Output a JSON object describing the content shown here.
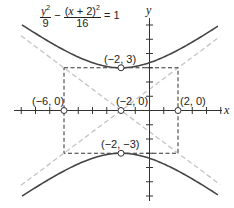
{
  "equation": {
    "term1_num_var": "y",
    "term1_num_exp": "2",
    "term1_den": "9",
    "operator": "−",
    "term2_num_open": "(",
    "term2_num_var": "x",
    "term2_num_rest": " + 2)",
    "term2_num_exp": "2",
    "term2_den": "16",
    "equals": "= 1"
  },
  "axes": {
    "x_label": "x",
    "y_label": "y",
    "origin_px": [
      149.5,
      110.5
    ],
    "unit_px": 14.25,
    "x_ticks": [
      -9,
      -8,
      -7,
      -6,
      -5,
      -4,
      -3,
      -2,
      -1,
      1,
      2,
      3,
      4,
      5
    ],
    "y_ticks": [
      -6,
      -5,
      -4,
      -3,
      -2,
      -1,
      1,
      2,
      3,
      4,
      5,
      6
    ]
  },
  "points": [
    {
      "label": "(−2, 3)",
      "x": -2,
      "y": 3,
      "role": "vertex"
    },
    {
      "label": "(−2, −3)",
      "x": -2,
      "y": -3,
      "role": "vertex"
    },
    {
      "label": "(−6, 0)",
      "x": -6,
      "y": 0,
      "role": "co-vertex"
    },
    {
      "label": "(2, 0)",
      "x": 2,
      "y": 0,
      "role": "co-vertex"
    },
    {
      "label": "(−2, 0)",
      "x": -2,
      "y": 0,
      "role": "center"
    }
  ],
  "hyperbola": {
    "h": -2,
    "k": 0,
    "a": 3,
    "b": 4,
    "orientation": "vertical"
  },
  "asymptotes": [
    "y = 3/4 (x + 2)",
    "y = −3/4 (x + 2)"
  ],
  "colors": {
    "curve": "#444444",
    "asymptote": "#c8c8c8",
    "box": "#333333",
    "axis": "#333333"
  }
}
